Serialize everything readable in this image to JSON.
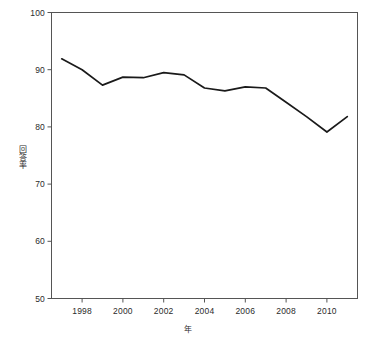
{
  "chart_data": {
    "type": "line",
    "title": "",
    "xlabel": "年",
    "ylabel": "回答率",
    "xlim": [
      1996.5,
      2011.5
    ],
    "ylim": [
      50,
      100
    ],
    "grid": false,
    "legend": null,
    "x": [
      1997,
      1998,
      1999,
      2000,
      2001,
      2002,
      2003,
      2004,
      2005,
      2006,
      2007,
      2008,
      2009,
      2010,
      2011
    ],
    "xticks": [
      1998,
      2000,
      2002,
      2004,
      2006,
      2008,
      2010
    ],
    "xtick_labels": [
      "1998",
      "2000",
      "2002",
      "2004",
      "2006",
      "2008",
      "2010"
    ],
    "yticks": [
      50,
      60,
      70,
      80,
      90,
      100
    ],
    "ytick_labels": [
      "50",
      "60",
      "70",
      "80",
      "90",
      "100"
    ],
    "series": [
      {
        "name": "回答率",
        "color": "#1a1a1a",
        "values": [
          91.9,
          90.0,
          87.3,
          88.7,
          88.6,
          89.5,
          89.1,
          86.8,
          86.3,
          87.0,
          86.8,
          84.3,
          81.8,
          79.1,
          81.8
        ]
      }
    ]
  },
  "axis": {
    "frame_color": "#555555",
    "line_color": "#1a1a1a"
  }
}
